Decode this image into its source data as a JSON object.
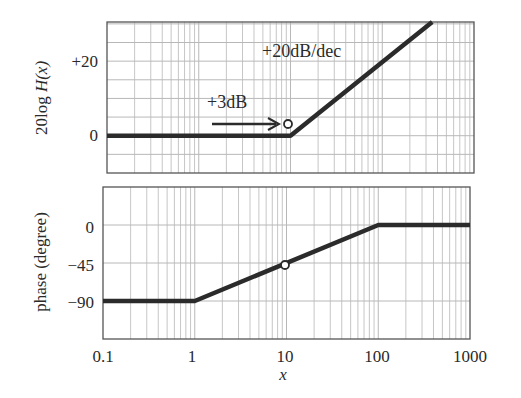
{
  "chart_data": [
    {
      "type": "line",
      "title": "",
      "xscale": "log",
      "xlim": [
        0.1,
        1000
      ],
      "ylim": [
        -10,
        30.5
      ],
      "xlabel": "",
      "ylabel": "20log H(x)",
      "grid": true,
      "yticks": [
        {
          "value": 0,
          "label": "0"
        },
        {
          "value": 20,
          "label": "+20"
        }
      ],
      "series": [
        {
          "name": "magnitude asymptote",
          "x": [
            0.1,
            10,
            350
          ],
          "y": [
            0,
            0,
            30.5
          ]
        }
      ],
      "markers": [
        {
          "x": 10,
          "y": 3,
          "style": "open-circle"
        }
      ],
      "annotations": [
        {
          "text": "+20dB/dec",
          "x": 30,
          "y": 24
        },
        {
          "text": "+3dB",
          "x": 1.5,
          "y": 7,
          "arrow_from_x": 1.2,
          "arrow_to_x": 9,
          "arrow_y": 3
        }
      ]
    },
    {
      "type": "line",
      "title": "",
      "xscale": "log",
      "xlim": [
        0.1,
        1000
      ],
      "ylim": [
        -135,
        45
      ],
      "xlabel": "x",
      "ylabel": "phase (degree)",
      "grid": true,
      "xticks": [
        {
          "value": 0.1,
          "label": "0.1"
        },
        {
          "value": 1,
          "label": "1"
        },
        {
          "value": 10,
          "label": "10"
        },
        {
          "value": 100,
          "label": "100"
        },
        {
          "value": 1000,
          "label": "1000"
        }
      ],
      "yticks": [
        {
          "value": 0,
          "label": "0"
        },
        {
          "value": -45,
          "label": "-45"
        },
        {
          "value": -90,
          "label": "-90"
        }
      ],
      "series": [
        {
          "name": "phase asymptote",
          "x": [
            0.1,
            1,
            100,
            1000
          ],
          "y": [
            -90,
            -90,
            0,
            0
          ]
        }
      ],
      "markers": [
        {
          "x": 10,
          "y": -45,
          "style": "open-circle"
        }
      ]
    }
  ],
  "labels": {
    "top_ylabel_prefix": "20log ",
    "top_ylabel_var": "H",
    "top_ylabel_arg": "(x)",
    "top_tick_20": "+20",
    "top_tick_0": "0",
    "slope": "+20dB/dec",
    "plus3": "+3dB",
    "bot_ylabel": "phase (degree)",
    "bot_tick_0": "0",
    "bot_tick_45": "−45",
    "bot_tick_90": "−90",
    "x_01": "0.1",
    "x_1": "1",
    "x_10": "10",
    "x_100": "100",
    "x_1000": "1000",
    "xlabel": "x"
  },
  "colors": {
    "curve": "#2b2b2b",
    "grid": "#b8b8b8",
    "frame": "#555555"
  }
}
